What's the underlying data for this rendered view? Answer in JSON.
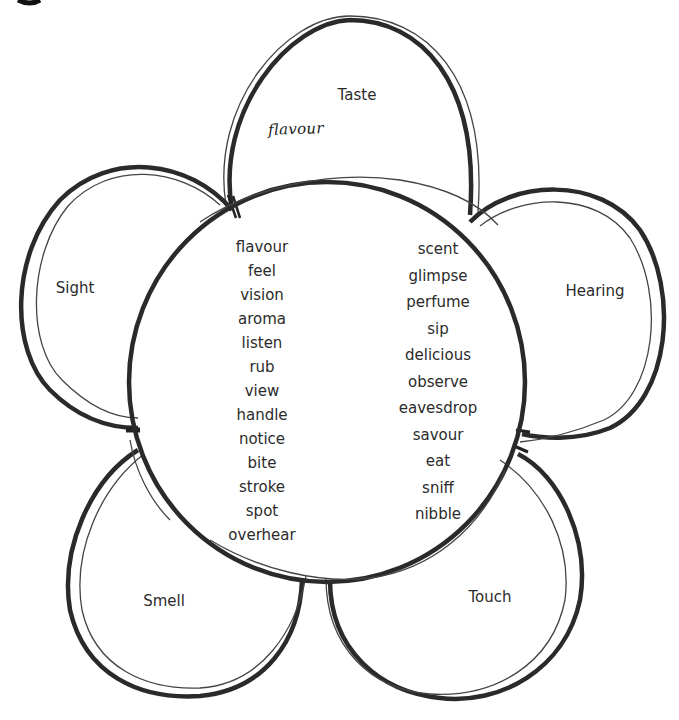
{
  "diagram": {
    "type": "senses-flower",
    "petals": [
      {
        "id": "taste",
        "label": "Taste",
        "answer": "flavour"
      },
      {
        "id": "hearing",
        "label": "Hearing",
        "answer": ""
      },
      {
        "id": "touch",
        "label": "Touch",
        "answer": ""
      },
      {
        "id": "smell",
        "label": "Smell",
        "answer": ""
      },
      {
        "id": "sight",
        "label": "Sight",
        "answer": ""
      }
    ],
    "word_bank": {
      "left_column": [
        "flavour",
        "feel",
        "vision",
        "aroma",
        "listen",
        "rub",
        "view",
        "handle",
        "notice",
        "bite",
        "stroke",
        "spot",
        "overhear"
      ],
      "right_column": [
        "scent",
        "glimpse",
        "perfume",
        "sip",
        "delicious",
        "observe",
        "eavesdrop",
        "savour",
        "eat",
        "sniff",
        "nibble"
      ]
    },
    "colors": {
      "line": "#2a2a2a",
      "thin_line": "#4a4a4a",
      "text": "#2b2b2b",
      "background": "#ffffff"
    }
  }
}
